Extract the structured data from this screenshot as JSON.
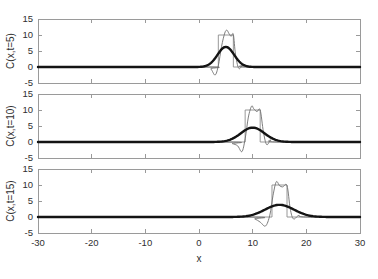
{
  "figure": {
    "title": "",
    "background_color": "#ffffff",
    "width": 378,
    "height": 279
  },
  "axes": {
    "x_label": "x",
    "x_ticks": [
      "-30",
      "-20",
      "-10",
      "0",
      "10",
      "20",
      "30"
    ],
    "x_tick_values": [
      -30,
      -20,
      -10,
      0,
      10,
      20,
      30
    ],
    "x_range": [
      -30,
      30
    ],
    "y_ticks": [
      "-5",
      "0",
      "5",
      "10",
      "15"
    ],
    "y_tick_values": [
      -5,
      0,
      5,
      10,
      15
    ],
    "y_range": [
      -5,
      15
    ]
  },
  "panels": [
    {
      "y_label": "C(x,t=5)"
    },
    {
      "y_label": "C(x,t=10)"
    },
    {
      "y_label": "C(x,t=15)"
    }
  ],
  "colors": {
    "frame": "#9a9a9a",
    "box_curve": "#8c8c8c",
    "oscillatory_curve": "#6e6e6e",
    "gaussian_curve": "#141414",
    "text": "#2f2f2f"
  },
  "chart_data": {
    "type": "line",
    "title": "",
    "xlabel": "x",
    "ylabel": "C(x,t)",
    "xlim": [
      -30,
      30
    ],
    "ylim": [
      -5,
      15
    ],
    "grid": false,
    "legend": "none",
    "subplot_layout": "3 rows x 1 column, shared x-axis",
    "subplots": [
      {
        "ylabel": "C(x,t=5)",
        "time": 5,
        "pulse_center": 5,
        "series": [
          {
            "name": "box-pulse",
            "style": "thin-grey-rectangular",
            "description": "Square pulse of height 10 centered at x=5, half-width 1.4",
            "x": [
              -30,
              3.6,
              3.6,
              6.4,
              6.4,
              30
            ],
            "values": [
              0,
              0,
              10,
              10,
              0,
              0
            ]
          },
          {
            "name": "oscillatory-numerical",
            "style": "thin-grey-wiggly",
            "description": "Dispersive numerical solution with overshoot ~11.5 and undershoot ~-2.5",
            "x": [
              -30,
              1.2,
              2.2,
              3.0,
              3.6,
              4.2,
              4.8,
              5.2,
              5.6,
              6.0,
              6.4,
              6.8,
              7.4,
              8.2,
              9.4,
              30
            ],
            "values": [
              0,
              0,
              -0.6,
              -2.5,
              0.4,
              6.4,
              10.6,
              11.5,
              10.4,
              9.6,
              10.2,
              4.0,
              -0.4,
              0.5,
              0,
              0
            ]
          },
          {
            "name": "gaussian-analytic",
            "style": "thick-black-smooth",
            "description": "Smooth Gaussian, peak 6.3 at x=5, sigma about 1.55",
            "peak_value": 6.3,
            "peak_x": 5,
            "sigma": 1.55
          }
        ]
      },
      {
        "ylabel": "C(x,t=10)",
        "time": 10,
        "pulse_center": 10,
        "series": [
          {
            "name": "box-pulse",
            "style": "thin-grey-rectangular",
            "description": "Square pulse of height 10 centered at x=10, half-width 1.4",
            "x": [
              -30,
              8.6,
              8.6,
              11.4,
              11.4,
              30
            ],
            "values": [
              0,
              0,
              10,
              10,
              0,
              0
            ]
          },
          {
            "name": "oscillatory-numerical",
            "style": "thin-grey-wiggly",
            "description": "Dispersive numerical solution with overshoot ~11.2 and undershoot ~-3.0",
            "x": [
              -30,
              5.0,
              6.2,
              7.2,
              8.0,
              8.6,
              9.2,
              9.8,
              10.2,
              10.8,
              11.4,
              12.0,
              12.6,
              13.4,
              14.4,
              30
            ],
            "values": [
              0,
              0,
              -0.5,
              -1.2,
              -3.0,
              1.0,
              7.8,
              11.2,
              10.4,
              9.5,
              10.0,
              3.2,
              -0.8,
              0.6,
              0,
              0
            ]
          },
          {
            "name": "gaussian-analytic",
            "style": "thick-black-smooth",
            "description": "Smooth Gaussian, peak 4.5 at x=10, sigma about 2.2",
            "peak_value": 4.5,
            "peak_x": 10,
            "sigma": 2.2
          }
        ]
      },
      {
        "ylabel": "C(x,t=15)",
        "time": 15,
        "pulse_center": 15,
        "series": [
          {
            "name": "box-pulse",
            "style": "thin-grey-rectangular",
            "description": "Square pulse of height 10 centered at x=15, half-width 1.4",
            "x": [
              -30,
              13.6,
              13.6,
              16.4,
              16.4,
              30
            ],
            "values": [
              0,
              0,
              10,
              10,
              0,
              0
            ]
          },
          {
            "name": "oscillatory-numerical",
            "style": "thin-grey-wiggly",
            "description": "Dispersive numerical solution with overshoot ~11.0 and undershoot ~-2.8",
            "x": [
              -30,
              9.0,
              10.4,
              11.4,
              12.4,
              13.2,
              13.8,
              14.4,
              15.0,
              15.6,
              16.4,
              17.0,
              17.6,
              18.6,
              19.8,
              30
            ],
            "values": [
              0,
              0,
              -0.6,
              -1.6,
              -2.8,
              0.6,
              6.8,
              11.0,
              9.8,
              9.4,
              9.8,
              2.6,
              -0.6,
              0.5,
              0,
              0
            ]
          },
          {
            "name": "gaussian-analytic",
            "style": "thick-black-smooth",
            "description": "Smooth Gaussian, peak 3.8 at x=15, sigma about 2.7",
            "peak_value": 3.8,
            "peak_x": 15,
            "sigma": 2.7
          }
        ]
      }
    ]
  }
}
